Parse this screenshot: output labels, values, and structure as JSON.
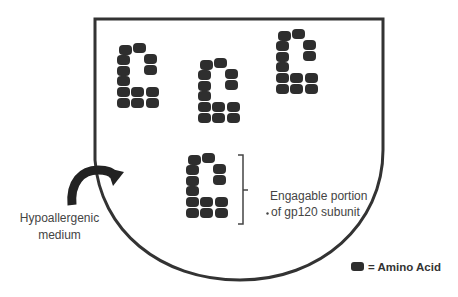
{
  "diagram": {
    "type": "schematic",
    "container": {
      "label": "",
      "stroke_color": "#333333"
    },
    "arrow_label": {
      "line1": "Hypoallergenic",
      "line2": "medium"
    },
    "bracket_label": {
      "line1": "Engagable portion",
      "line2": "of gp120 subunit"
    },
    "legend": {
      "symbol": "amino-acid-block",
      "text": "= Amino Acid",
      "color": "#2e2e2e"
    },
    "clusters": [
      {
        "id": "cluster-1",
        "origin": [
          117,
          45
        ]
      },
      {
        "id": "cluster-2",
        "origin": [
          198,
          60
        ]
      },
      {
        "id": "cluster-3",
        "origin": [
          276,
          31
        ]
      },
      {
        "id": "cluster-4",
        "origin": [
          186,
          155
        ]
      }
    ],
    "amino_acid_color": "#2e2e2e"
  }
}
